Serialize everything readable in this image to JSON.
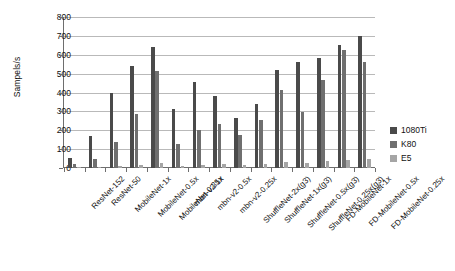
{
  "chart_data": {
    "type": "bar",
    "title": "",
    "xlabel": "",
    "ylabel": "Sampels/s",
    "ylim": [
      0,
      800
    ],
    "ytick_step": 100,
    "yticks": [
      "800",
      "700",
      "600",
      "500",
      "400",
      "300",
      "200",
      "100",
      "0"
    ],
    "grid": true,
    "legend_position": "right",
    "categories": [
      "ResNet-152",
      "ResNet-50",
      "MobileNet-1x",
      "MobileNet-0.5x",
      "MobileNet-0.25x",
      "mbn-v2-1x",
      "mbn-v2-0.5x",
      "mbn-v2-0.25x",
      "ShuffleNet-2x(g3)",
      "ShuffleNet-1x(g3)",
      "ShuffleNet-0.5x(g3)",
      "ShuffleNet-0.25x(g3)",
      "FD-MobileNet-1x",
      "FD-MobileNet-0.5x",
      "FD-MobileNet-0.25x"
    ],
    "series": [
      {
        "name": "1080Ti",
        "color": "#4a4a4a",
        "values": [
          55,
          170,
          396,
          540,
          640,
          311,
          455,
          380,
          264,
          340,
          519,
          564,
          581,
          650,
          700
        ]
      },
      {
        "name": "K80",
        "color": "#6f6f6f",
        "values": [
          22,
          50,
          138,
          285,
          512,
          126,
          201,
          234,
          177,
          253,
          411,
          298,
          465,
          626,
          560
        ]
      },
      {
        "name": "E5",
        "color": "#a5a5a5",
        "values": [
          4,
          8,
          10,
          18,
          24,
          13,
          17,
          20,
          15,
          22,
          30,
          28,
          36,
          42,
          50
        ]
      }
    ]
  },
  "legend": {
    "items": [
      {
        "label": "1080Ti",
        "color": "#4a4a4a"
      },
      {
        "label": "K80",
        "color": "#6f6f6f"
      },
      {
        "label": "E5",
        "color": "#a5a5a5"
      }
    ]
  }
}
